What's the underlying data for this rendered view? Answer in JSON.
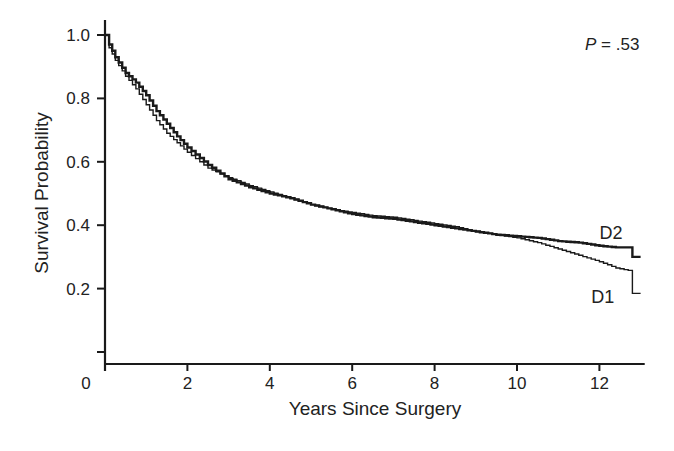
{
  "chart_data": {
    "type": "line",
    "subtype": "kaplan-meier step",
    "title": "",
    "xlabel": "Years Since Surgery",
    "ylabel": "Survival Probability",
    "xlim": [
      0,
      13.1
    ],
    "ylim": [
      0,
      1.05
    ],
    "x_ticks": [
      0,
      2,
      4,
      6,
      8,
      10,
      12
    ],
    "x_tick_labels": [
      "0",
      "2",
      "4",
      "6",
      "8",
      "10",
      "12"
    ],
    "y_ticks": [
      0.0,
      0.2,
      0.4,
      0.6,
      0.8,
      1.0
    ],
    "y_tick_labels": [
      "",
      "0.2",
      "0.4",
      "0.6",
      "0.8",
      "1.0"
    ],
    "grid": false,
    "legend": "none (direct labels)",
    "annotation": {
      "text_italic": "P",
      "text_rest": " = .53"
    },
    "series": [
      {
        "name": "D2",
        "stroke_width": 2.4,
        "color": "#1a1a1a",
        "label_pos": {
          "x": 12.0,
          "y": 0.355
        },
        "x": [
          0,
          0.1,
          0.25,
          0.5,
          0.75,
          1.0,
          1.25,
          1.5,
          1.75,
          2.0,
          2.5,
          3.0,
          3.5,
          4.0,
          4.5,
          5.0,
          5.5,
          6.0,
          6.5,
          7.0,
          7.5,
          8.0,
          8.5,
          9.0,
          9.5,
          10.0,
          10.5,
          11.0,
          11.5,
          12.0,
          12.4,
          12.8,
          12.8,
          13.0
        ],
        "values": [
          1.0,
          0.97,
          0.93,
          0.88,
          0.85,
          0.81,
          0.76,
          0.72,
          0.68,
          0.645,
          0.59,
          0.545,
          0.52,
          0.5,
          0.485,
          0.465,
          0.45,
          0.435,
          0.425,
          0.42,
          0.41,
          0.4,
          0.39,
          0.38,
          0.37,
          0.365,
          0.36,
          0.35,
          0.345,
          0.335,
          0.33,
          0.33,
          0.3,
          0.3
        ]
      },
      {
        "name": "D1",
        "stroke_width": 1.4,
        "color": "#1a1a1a",
        "label_pos": {
          "x": 11.8,
          "y": 0.155
        },
        "x": [
          0,
          0.1,
          0.25,
          0.5,
          0.75,
          1.0,
          1.25,
          1.5,
          1.75,
          2.0,
          2.5,
          3.0,
          3.5,
          4.0,
          4.5,
          5.0,
          5.5,
          6.0,
          6.5,
          7.0,
          7.5,
          8.0,
          8.5,
          9.0,
          9.5,
          10.0,
          10.5,
          11.0,
          11.5,
          12.0,
          12.4,
          12.8,
          12.8,
          13.0
        ],
        "values": [
          1.0,
          0.96,
          0.92,
          0.87,
          0.83,
          0.78,
          0.73,
          0.69,
          0.66,
          0.63,
          0.58,
          0.55,
          0.525,
          0.505,
          0.485,
          0.465,
          0.45,
          0.44,
          0.43,
          0.425,
          0.415,
          0.405,
          0.395,
          0.38,
          0.37,
          0.36,
          0.345,
          0.325,
          0.305,
          0.285,
          0.265,
          0.255,
          0.185,
          0.185
        ]
      }
    ]
  }
}
